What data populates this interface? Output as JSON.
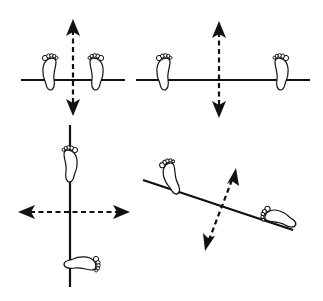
{
  "figure": {
    "colors": {
      "ink": "#111111",
      "background": "#ffffff"
    },
    "panels": [
      {
        "id": "narrow-stance",
        "line_orientation": "horizontal",
        "arrow_orientation": "vertical",
        "feet": [
          "left-foot",
          "right-foot"
        ]
      },
      {
        "id": "wide-stance",
        "line_orientation": "horizontal",
        "arrow_orientation": "vertical",
        "feet": [
          "left-foot",
          "right-foot"
        ]
      },
      {
        "id": "rotated-stance",
        "line_orientation": "vertical",
        "arrow_orientation": "horizontal",
        "feet": [
          "top-foot",
          "bottom-foot"
        ]
      },
      {
        "id": "oblique-stance",
        "line_orientation": "oblique",
        "arrow_orientation": "oblique",
        "feet": [
          "left-foot",
          "right-foot"
        ]
      }
    ]
  }
}
